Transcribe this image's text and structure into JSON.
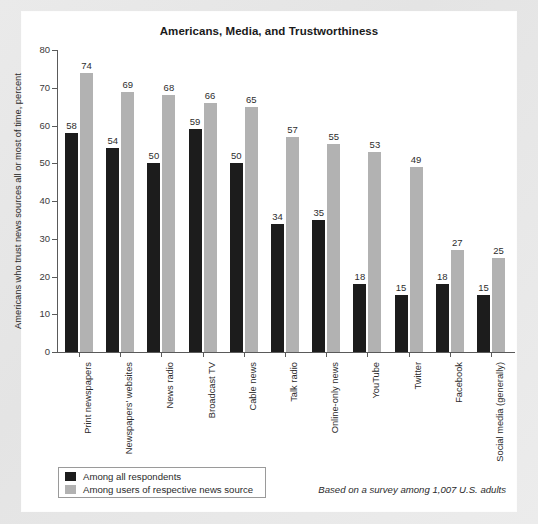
{
  "chart_data": {
    "type": "bar",
    "title": "Americans, Media, and Trustworthiness",
    "xlabel": "",
    "ylabel": "Americans who trust news sources all or most of time, percent",
    "ylim": [
      0,
      80
    ],
    "yticks": [
      0,
      10,
      20,
      30,
      40,
      50,
      60,
      70,
      80
    ],
    "grid": false,
    "legend_position": "bottom-left",
    "categories": [
      "Print newspapers",
      "Newspapers' websites",
      "News radio",
      "Broadcast TV",
      "Cable news",
      "Talk radio",
      "Online-only news",
      "YouTube",
      "Twitter",
      "Facebook",
      "Social media (generally)"
    ],
    "series": [
      {
        "name": "Among all respondents",
        "color": "#1c1c1c",
        "values": [
          58,
          54,
          50,
          59,
          50,
          34,
          35,
          18,
          15,
          18,
          15
        ]
      },
      {
        "name": "Among users of respective news source",
        "color": "#b2b2b2",
        "values": [
          74,
          69,
          68,
          66,
          65,
          57,
          55,
          53,
          49,
          27,
          25
        ]
      }
    ],
    "annotation": "Based on a survey among 1,007 U.S. adults"
  },
  "colors": {
    "page_background": "#e8e8e8",
    "card_background": "#ffffff",
    "axis": "#5a5a5a",
    "series_all": "#1c1c1c",
    "series_users": "#b2b2b2",
    "text": "#2b2b2b"
  }
}
